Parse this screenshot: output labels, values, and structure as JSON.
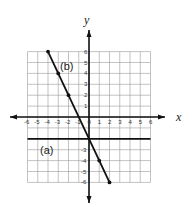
{
  "chart_data": {
    "type": "line",
    "title": "",
    "xlabel": "x",
    "ylabel": "y",
    "xlim": [
      -6,
      6
    ],
    "ylim": [
      -6,
      6
    ],
    "grid": true,
    "x_ticks": [
      "-6",
      "-5",
      "-4",
      "-3",
      "-2",
      "-1",
      "0",
      "1",
      "2",
      "3",
      "4",
      "5",
      "6"
    ],
    "y_ticks": [
      "6",
      "5",
      "4",
      "3",
      "2",
      "1",
      "-3",
      "-4",
      "-5",
      "-6"
    ],
    "series": [
      {
        "name": "(a)",
        "equation": "y = -2",
        "points": [
          [
            -6,
            -2
          ],
          [
            6,
            -2
          ]
        ]
      },
      {
        "name": "(b)",
        "equation": "y = -2x - 2",
        "points": [
          [
            -4,
            6
          ],
          [
            -3,
            4
          ],
          [
            -2,
            2
          ],
          [
            1,
            -4
          ],
          [
            2,
            -6
          ]
        ]
      }
    ]
  },
  "labels": {
    "x_axis": "x",
    "y_axis": "y",
    "line_a": "(a)",
    "line_b": "(b)"
  }
}
